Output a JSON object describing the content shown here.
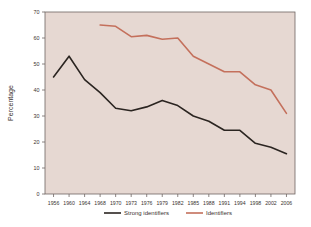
{
  "chart_data": {
    "type": "line",
    "title": "",
    "xlabel": "",
    "ylabel": "Percentage",
    "ylim": [
      0,
      70
    ],
    "ytick_step": 10,
    "yticks": [
      "0",
      "10",
      "20",
      "30",
      "40",
      "50",
      "60",
      "70"
    ],
    "grid": false,
    "legend_position": "bottom",
    "plot_background_color": "#e6d8d2",
    "categories": [
      "1956",
      "1960",
      "1964",
      "1968",
      "1970",
      "1973",
      "1976",
      "1979",
      "1982",
      "1985",
      "1988",
      "1991",
      "1994",
      "1998",
      "2002",
      "2006"
    ],
    "series": [
      {
        "name": "Strong identifiers",
        "color": "#2b2521",
        "values": [
          45,
          53,
          44,
          39,
          33,
          32,
          33.5,
          36,
          34,
          30,
          28,
          24.5,
          24.5,
          19.5,
          18,
          15.5
        ]
      },
      {
        "name": "Identifiers",
        "color": "#c4705c",
        "values": [
          null,
          null,
          null,
          65,
          64.5,
          60.5,
          61,
          59.5,
          60,
          53,
          50,
          47,
          47,
          42,
          40,
          31
        ]
      }
    ]
  },
  "axes": {
    "y_axis_title": "Percentage"
  },
  "legend": {
    "items": [
      {
        "label": "Strong identifiers",
        "color": "#2b2521"
      },
      {
        "label": "Identifiers",
        "color": "#c4705c"
      }
    ]
  }
}
